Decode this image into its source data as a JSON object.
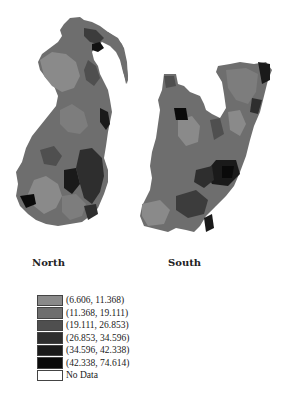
{
  "map": {
    "regions": [
      {
        "id": "north",
        "label": "North"
      },
      {
        "id": "south",
        "label": "South"
      }
    ]
  },
  "legend": {
    "items": [
      {
        "label": "(6.606, 11.368)",
        "color": "#8a8a8a"
      },
      {
        "label": "(11.368, 19.111)",
        "color": "#6e6e6e"
      },
      {
        "label": "(19.111, 26.853)",
        "color": "#4f4f4f"
      },
      {
        "label": "(26.853, 34.596)",
        "color": "#2e2e2e"
      },
      {
        "label": "(34.596, 42.338)",
        "color": "#1a1a1a"
      },
      {
        "label": "(42.338, 74.614)",
        "color": "#0a0a0a"
      },
      {
        "label": "No Data",
        "color": "#ffffff"
      }
    ]
  }
}
